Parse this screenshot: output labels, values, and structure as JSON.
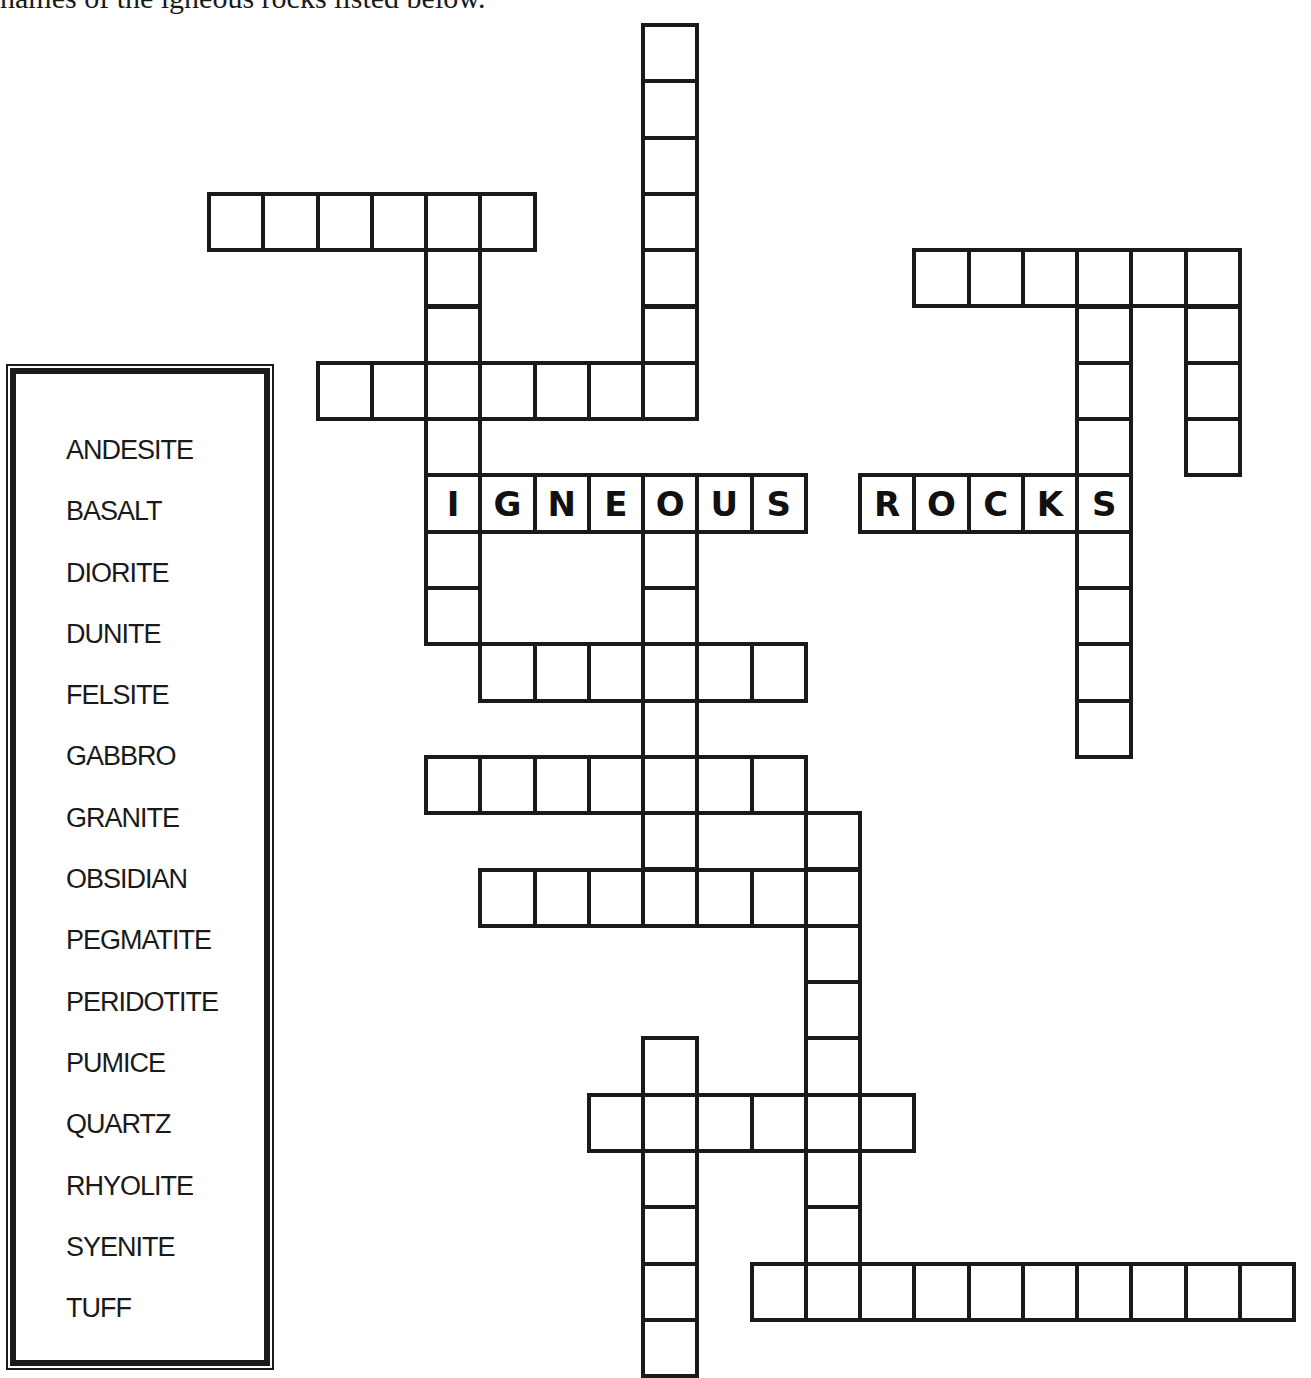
{
  "puzzle": {
    "instructions": "names of the igneous rocks listed below.",
    "theme_label_words": [
      "IGNEOUS",
      "ROCKS"
    ]
  },
  "word_bank": {
    "title": "",
    "words": [
      "ANDESITE",
      "BASALT",
      "DIORITE",
      "DUNITE",
      "FELSITE",
      "GABBRO",
      "GRANITE",
      "OBSIDIAN",
      "PEGMATITE",
      "PERIDOTITE",
      "PUMICE",
      "QUARTZ",
      "RHYOLITE",
      "SYENITE",
      "TUFF"
    ]
  },
  "grid": {
    "origin_x": 209,
    "origin_y": 25,
    "col_pitch": 54.25,
    "row_pitch": 56.3,
    "entries": [
      {
        "id": "v-top",
        "dir": "down",
        "row": 0,
        "col": 8,
        "length": 7,
        "letters": ""
      },
      {
        "id": "h-row3",
        "dir": "across",
        "row": 3,
        "col": 0,
        "length": 6,
        "letters": ""
      },
      {
        "id": "h-row6",
        "dir": "across",
        "row": 6,
        "col": 2,
        "length": 7,
        "letters": ""
      },
      {
        "id": "v-col4",
        "dir": "down",
        "row": 3,
        "col": 4,
        "length": 8,
        "letters": ""
      },
      {
        "id": "igneous",
        "dir": "across",
        "row": 8,
        "col": 4,
        "length": 7,
        "letters": "IGNEOUS"
      },
      {
        "id": "rocks",
        "dir": "across",
        "row": 8,
        "col": 12,
        "length": 5,
        "letters": "ROCKS"
      },
      {
        "id": "h-row4-right",
        "dir": "across",
        "row": 4,
        "col": 13,
        "length": 6,
        "letters": ""
      },
      {
        "id": "v-col16",
        "dir": "down",
        "row": 4,
        "col": 16,
        "length": 9,
        "letters": ""
      },
      {
        "id": "v-col18",
        "dir": "down",
        "row": 4,
        "col": 18,
        "length": 4,
        "letters": ""
      },
      {
        "id": "v-col8-mid",
        "dir": "down",
        "row": 8,
        "col": 8,
        "length": 8,
        "letters": ""
      },
      {
        "id": "h-row11",
        "dir": "across",
        "row": 11,
        "col": 5,
        "length": 6,
        "letters": ""
      },
      {
        "id": "h-row13",
        "dir": "across",
        "row": 13,
        "col": 4,
        "length": 7,
        "letters": ""
      },
      {
        "id": "h-row15",
        "dir": "across",
        "row": 15,
        "col": 5,
        "length": 7,
        "letters": ""
      },
      {
        "id": "v-col11",
        "dir": "down",
        "row": 14,
        "col": 11,
        "length": 9,
        "letters": ""
      },
      {
        "id": "h-row19",
        "dir": "across",
        "row": 19,
        "col": 7,
        "length": 6,
        "letters": ""
      },
      {
        "id": "v-col8-bottom",
        "dir": "down",
        "row": 18,
        "col": 8,
        "length": 6,
        "letters": ""
      },
      {
        "id": "h-row22",
        "dir": "across",
        "row": 22,
        "col": 10,
        "length": 10,
        "letters": ""
      }
    ]
  },
  "colors": {
    "ink": "#1a1a1a",
    "paper": "#ffffff"
  }
}
